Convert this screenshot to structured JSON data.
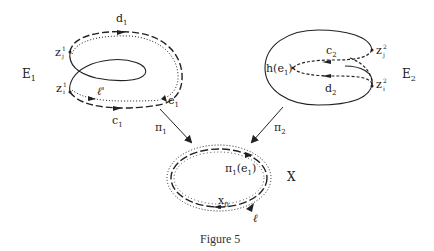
{
  "figure": {
    "caption": "Figure 5",
    "left_space": {
      "name": "E",
      "name_sub": "1",
      "top_path": "d",
      "top_path_sub": "1",
      "bottom_path": "c",
      "bottom_path_sub": "1",
      "point_top": "z",
      "point_top_sup": "1",
      "point_top_sub": "j",
      "point_bottom": "z",
      "point_bottom_sup": "1",
      "point_bottom_sub": "i",
      "loop": "ℓ'",
      "edge": "e",
      "edge_sub": "1"
    },
    "right_space": {
      "name": "E",
      "name_sub": "2",
      "top_path": "c",
      "top_path_sub": "2",
      "bottom_path": "d",
      "bottom_path_sub": "2",
      "point_top": "z",
      "point_top_sup": "2",
      "point_top_sub": "j",
      "point_bottom": "z",
      "point_bottom_sup": "2",
      "point_bottom_sub": "i",
      "vertex_prefix": "h(e",
      "vertex_sub": "1",
      "vertex_suffix": ")"
    },
    "base_space": {
      "name": "X",
      "edge_image_prefix": "π",
      "edge_image_sub1": "1",
      "edge_image_mid": "(e",
      "edge_image_sub2": "1",
      "edge_image_suffix": ")",
      "basepoint": "x",
      "basepoint_sub": "0",
      "loop": "ℓ"
    },
    "maps": {
      "left": "π",
      "left_sub": "1",
      "right": "π",
      "right_sub": "2"
    },
    "colors": {
      "stroke": "#222222",
      "background": "#ffffff"
    }
  }
}
